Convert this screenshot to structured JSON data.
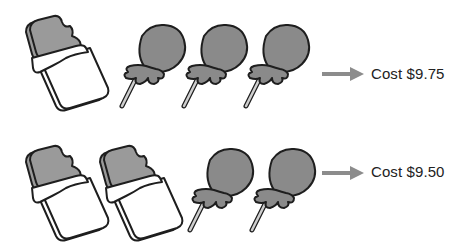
{
  "colors": {
    "outline": "#1e1e1e",
    "chocolate_fill": "#9a9a9a",
    "lollipop_fill": "#8a8a8a",
    "wrapper_fill": "#ffffff",
    "arrow": "#8c8c8c",
    "text": "#222222"
  },
  "rows": [
    {
      "items": [
        {
          "type": "chocolate-bar",
          "icon": "chocolate-bar-icon"
        },
        {
          "type": "lollipop",
          "icon": "lollipop-icon"
        },
        {
          "type": "lollipop",
          "icon": "lollipop-icon"
        },
        {
          "type": "lollipop",
          "icon": "lollipop-icon"
        }
      ],
      "counts": {
        "chocolate_bars": 1,
        "lollipops": 3
      },
      "arrow_icon": "arrow-right-icon",
      "cost_label": "Cost $9.75"
    },
    {
      "items": [
        {
          "type": "chocolate-bar",
          "icon": "chocolate-bar-icon"
        },
        {
          "type": "chocolate-bar",
          "icon": "chocolate-bar-icon"
        },
        {
          "type": "lollipop",
          "icon": "lollipop-icon"
        },
        {
          "type": "lollipop",
          "icon": "lollipop-icon"
        }
      ],
      "counts": {
        "chocolate_bars": 2,
        "lollipops": 2
      },
      "arrow_icon": "arrow-right-icon",
      "cost_label": "Cost $9.50"
    }
  ]
}
